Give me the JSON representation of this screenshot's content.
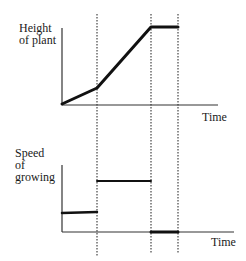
{
  "diagram": {
    "top_chart": {
      "y_label_lines": [
        "Height",
        "of plant"
      ],
      "x_label": "Time",
      "curve_points": [
        [
          62,
          104
        ],
        [
          97,
          88
        ],
        [
          151,
          27
        ],
        [
          178,
          27
        ]
      ],
      "description": "Height of plant increases slowly, then faster, then stays constant"
    },
    "bottom_chart": {
      "y_label_lines": [
        "Speed",
        "of",
        "growing"
      ],
      "x_label": "Time",
      "segments": [
        {
          "from": [
            62,
            213
          ],
          "to": [
            97,
            212
          ],
          "meaning": "low constant speed"
        },
        {
          "from": [
            97,
            181
          ],
          "to": [
            151,
            181
          ],
          "meaning": "higher constant speed"
        },
        {
          "from": [
            151,
            232
          ],
          "to": [
            178,
            232
          ],
          "meaning": "zero speed"
        }
      ]
    },
    "dotted_guides_x": [
      97,
      151,
      178
    ],
    "colors": {
      "line": "#111111",
      "axis": "#333333",
      "dotted": "#444444",
      "background": "#ffffff"
    }
  }
}
